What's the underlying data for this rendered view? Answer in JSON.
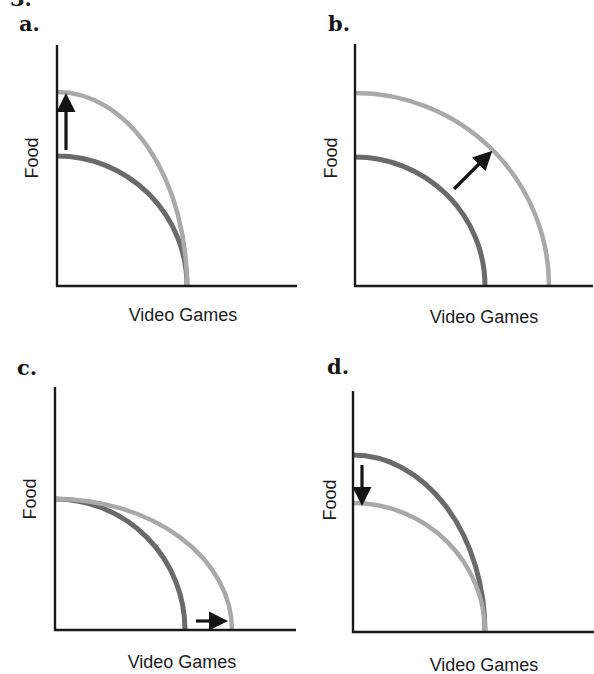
{
  "figure": {
    "clipped_top_fragment": "3.",
    "colors": {
      "axis": "#1a1a1a",
      "original_curve": "#6a6a6a",
      "new_curve": "#a9a9a9",
      "arrow": "#141414"
    }
  },
  "chart_data": [
    {
      "type": "line",
      "panel": "a.",
      "title": "a.",
      "xlabel": "Video Games",
      "ylabel": "Food",
      "grid": false,
      "description": "PPF shift: Food intercept increases, Video Games intercept unchanged",
      "series": [
        {
          "name": "original PPF",
          "color": "#6a6a6a",
          "x_intercept": 130,
          "y_intercept": 130
        },
        {
          "name": "new PPF",
          "color": "#a9a9a9",
          "x_intercept": 130,
          "y_intercept": 194
        }
      ],
      "arrow": {
        "direction": "up",
        "from": [
          10,
          136
        ],
        "to": [
          10,
          184
        ]
      },
      "geom": {
        "axis_x": 57,
        "axis_y": 286,
        "axis_top": 45,
        "axis_right": 297,
        "curves": [
          {
            "rx": 130,
            "ry": 130,
            "color_key": "original_curve",
            "width": 5
          },
          {
            "rx": 130,
            "ry": 194,
            "color_key": "new_curve",
            "width": 4.5
          }
        ],
        "arrow_px": {
          "x1": 66,
          "y1": 150,
          "x2": 66,
          "y2": 102
        },
        "letter_pos": {
          "x": 19,
          "y": 13
        },
        "xlabel_pos": {
          "x": 183,
          "y": 315
        },
        "ylabel_pos": {
          "x": 32,
          "y": 158
        }
      }
    },
    {
      "type": "line",
      "panel": "b.",
      "title": "b.",
      "xlabel": "Video Games",
      "ylabel": "Food",
      "grid": false,
      "description": "PPF shifts outward: both intercepts increase",
      "series": [
        {
          "name": "original PPF",
          "color": "#6a6a6a",
          "x_intercept": 130,
          "y_intercept": 129
        },
        {
          "name": "new PPF",
          "color": "#a9a9a9",
          "x_intercept": 194,
          "y_intercept": 193
        }
      ],
      "arrow": {
        "direction": "outward (up-right)",
        "from": [
          99,
          97
        ],
        "to": [
          131,
          129
        ]
      },
      "geom": {
        "axis_x": 355,
        "axis_y": 286,
        "axis_top": 44,
        "axis_right": 593,
        "curves": [
          {
            "rx": 130,
            "ry": 129,
            "color_key": "original_curve",
            "width": 5
          },
          {
            "rx": 194,
            "ry": 193,
            "color_key": "new_curve",
            "width": 4.5
          }
        ],
        "arrow_px": {
          "x1": 454,
          "y1": 189,
          "x2": 486,
          "y2": 157
        },
        "letter_pos": {
          "x": 328,
          "y": 13
        },
        "xlabel_pos": {
          "x": 484,
          "y": 317
        },
        "ylabel_pos": {
          "x": 331,
          "y": 158
        }
      }
    },
    {
      "type": "line",
      "panel": "c.",
      "title": "c.",
      "xlabel": "Video Games",
      "ylabel": "Food",
      "grid": false,
      "description": "PPF shift: Video Games intercept increases, Food intercept unchanged",
      "series": [
        {
          "name": "original PPF",
          "color": "#6a6a6a",
          "x_intercept": 130,
          "y_intercept": 131
        },
        {
          "name": "new PPF",
          "color": "#a9a9a9",
          "x_intercept": 177,
          "y_intercept": 131
        }
      ],
      "arrow": {
        "direction": "right",
        "from": [
          141,
          9
        ],
        "to": [
          164,
          9
        ]
      },
      "geom": {
        "axis_x": 55,
        "axis_y": 630,
        "axis_top": 387,
        "axis_right": 296,
        "curves": [
          {
            "rx": 130,
            "ry": 131,
            "color_key": "original_curve",
            "width": 5
          },
          {
            "rx": 177,
            "ry": 131,
            "color_key": "new_curve",
            "width": 4.5
          }
        ],
        "arrow_px": {
          "x1": 196,
          "y1": 621,
          "x2": 219,
          "y2": 621
        },
        "letter_pos": {
          "x": 17,
          "y": 357
        },
        "xlabel_pos": {
          "x": 182,
          "y": 662
        },
        "ylabel_pos": {
          "x": 30,
          "y": 499
        }
      }
    },
    {
      "type": "line",
      "panel": "d.",
      "title": "d.",
      "xlabel": "Video Games",
      "ylabel": "Food",
      "grid": false,
      "description": "PPF shift: Food intercept decreases, Video Games intercept unchanged",
      "series": [
        {
          "name": "original PPF",
          "color": "#6a6a6a",
          "x_intercept": 132,
          "y_intercept": 177
        },
        {
          "name": "new PPF",
          "color": "#a9a9a9",
          "x_intercept": 132,
          "y_intercept": 129
        }
      ],
      "arrow": {
        "direction": "down",
        "from": [
          9,
          167
        ],
        "to": [
          9,
          135
        ]
      },
      "geom": {
        "axis_x": 353,
        "axis_y": 632,
        "axis_top": 391,
        "axis_right": 594,
        "curves": [
          {
            "rx": 132,
            "ry": 177,
            "color_key": "original_curve",
            "width": 5
          },
          {
            "rx": 132,
            "ry": 129,
            "color_key": "new_curve",
            "width": 4.5
          }
        ],
        "arrow_px": {
          "x1": 362,
          "y1": 465,
          "x2": 362,
          "y2": 497
        },
        "letter_pos": {
          "x": 327,
          "y": 356
        },
        "xlabel_pos": {
          "x": 484,
          "y": 665
        },
        "ylabel_pos": {
          "x": 330,
          "y": 500
        }
      }
    }
  ]
}
